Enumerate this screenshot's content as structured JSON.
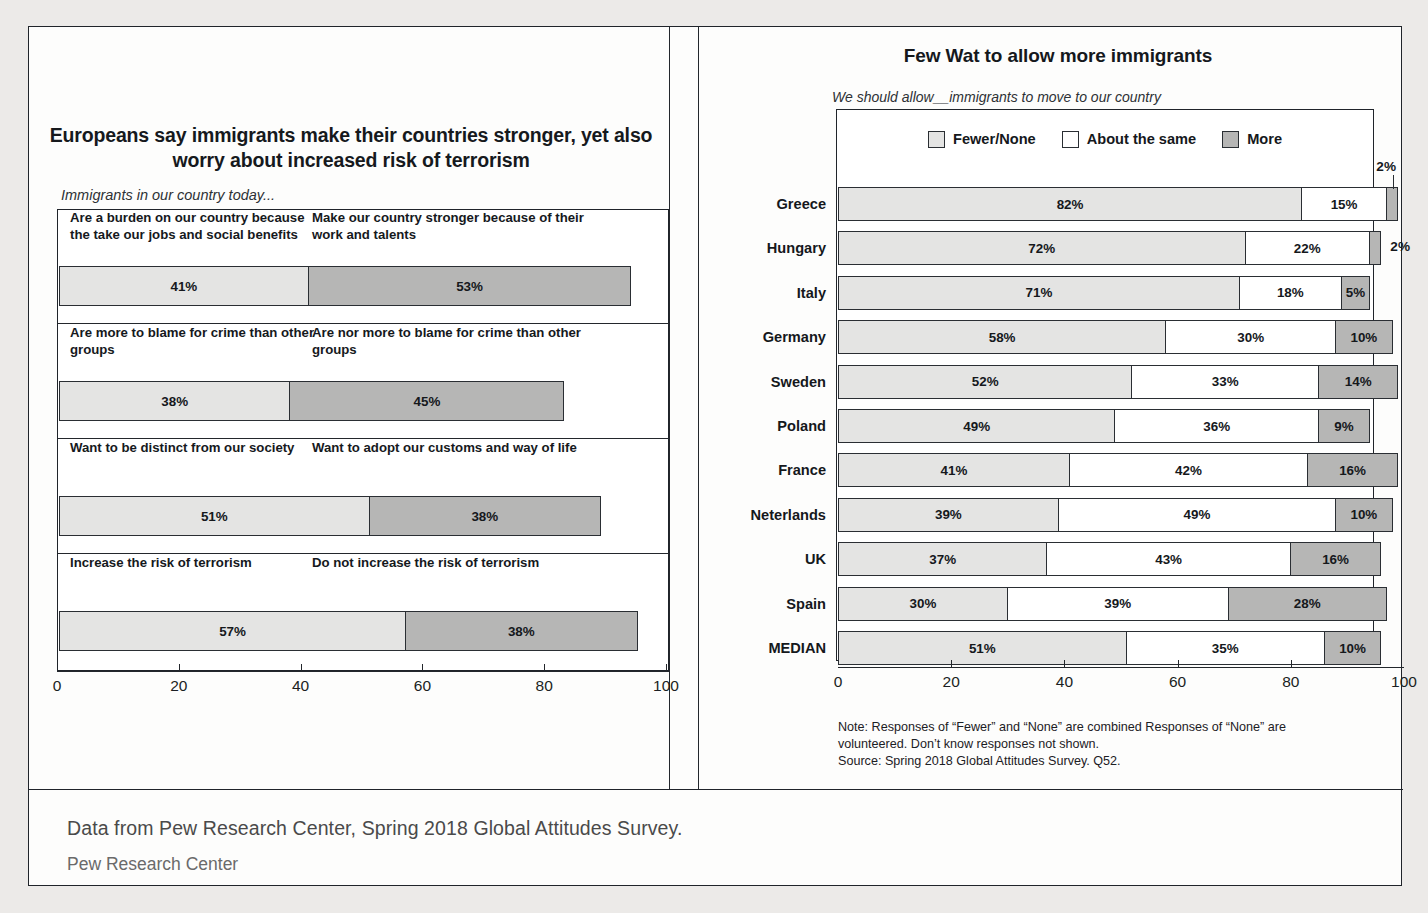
{
  "clipped_top_text": "",
  "footer": {
    "line1": "Data from Pew Research Center, Spring 2018 Global Attitudes Survey.",
    "line2": "Pew Research Center"
  },
  "chart_data": [
    {
      "type": "bar",
      "id": "left-opposing-pairs",
      "title": "Europeans say immigrants make their countries stronger, yet also worry about increased risk of terrorism",
      "subtitle": "Immigrants in our country today...",
      "xlabel": "",
      "ylabel": "",
      "xlim": [
        0,
        100
      ],
      "xticks": [
        0,
        20,
        40,
        60,
        80,
        100
      ],
      "xtick_labels": [
        "0",
        "20",
        "40",
        "60",
        "80",
        "100"
      ],
      "grid": false,
      "legend_position": "none",
      "orientation": "horizontal",
      "stacked": true,
      "series": [
        {
          "name": "Left statement",
          "color": "#e4e4e3"
        },
        {
          "name": "Right statement",
          "color": "#b6b6b5"
        }
      ],
      "rows": [
        {
          "left_label": "Are a burden on our country because the take our jobs and social benefits",
          "right_label": "Make our country stronger because of their work and talents",
          "left_value": 41,
          "right_value": 53,
          "left_value_label": "41%",
          "right_value_label": "53%"
        },
        {
          "left_label": "Are more to blame for crime than other groups",
          "right_label": "Are nor more to blame for crime than other groups",
          "left_value": 38,
          "right_value": 45,
          "left_value_label": "38%",
          "right_value_label": "45%"
        },
        {
          "left_label": "Want to be distinct from our society",
          "right_label": "Want to adopt our customs and way of life",
          "left_value": 51,
          "right_value": 38,
          "left_value_label": "51%",
          "right_value_label": "38%"
        },
        {
          "left_label": "Increase the risk of terrorism",
          "right_label": "Do not increase the risk of terrorism",
          "left_value": 57,
          "right_value": 38,
          "left_value_label": "57%",
          "right_value_label": "38%"
        }
      ]
    },
    {
      "type": "bar",
      "id": "right-allow-immigrants",
      "title": "Few Wat to allow more immigrants",
      "subtitle": "We should allow__immigrants to move to our country",
      "xlabel": "",
      "ylabel": "",
      "xlim": [
        0,
        100
      ],
      "xticks": [
        0,
        20,
        40,
        60,
        80,
        100
      ],
      "xtick_labels": [
        "0",
        "20",
        "40",
        "60",
        "80",
        "100"
      ],
      "grid": false,
      "legend_position": "top",
      "orientation": "horizontal",
      "stacked": true,
      "legend": [
        "Fewer/None",
        "About the same",
        "More"
      ],
      "series": [
        {
          "name": "Fewer/None",
          "color": "#e4e4e3",
          "values": [
            82,
            72,
            71,
            58,
            52,
            49,
            41,
            39,
            37,
            30,
            51
          ]
        },
        {
          "name": "About the same",
          "color": "#ffffff",
          "values": [
            15,
            22,
            18,
            30,
            33,
            36,
            42,
            49,
            43,
            39,
            35
          ]
        },
        {
          "name": "More",
          "color": "#b6b6b5",
          "values": [
            2,
            2,
            5,
            10,
            14,
            9,
            16,
            10,
            16,
            28,
            10
          ]
        }
      ],
      "categories": [
        "Greece",
        "Hungary",
        "Italy",
        "Germany",
        "Sweden",
        "Poland",
        "France",
        "Neterlands",
        "UK",
        "Spain",
        "MEDIAN"
      ],
      "rows": [
        {
          "name": "Greece",
          "few": 82,
          "same": 15,
          "more": 2,
          "few_label": "82%",
          "same_label": "15%",
          "more_label": "2%",
          "more_outside": true,
          "more_leader": "up"
        },
        {
          "name": "Hungary",
          "few": 72,
          "same": 22,
          "more": 2,
          "few_label": "72%",
          "same_label": "22%",
          "more_label": "2%",
          "more_outside": true,
          "more_leader": "none"
        },
        {
          "name": "Italy",
          "few": 71,
          "same": 18,
          "more": 5,
          "few_label": "71%",
          "same_label": "18%",
          "more_label": "5%",
          "more_outside": false
        },
        {
          "name": "Germany",
          "few": 58,
          "same": 30,
          "more": 10,
          "few_label": "58%",
          "same_label": "30%",
          "more_label": "10%",
          "more_outside": false
        },
        {
          "name": "Sweden",
          "few": 52,
          "same": 33,
          "more": 14,
          "few_label": "52%",
          "same_label": "33%",
          "more_label": "14%",
          "more_outside": false
        },
        {
          "name": "Poland",
          "few": 49,
          "same": 36,
          "more": 9,
          "few_label": "49%",
          "same_label": "36%",
          "more_label": "9%",
          "more_outside": false
        },
        {
          "name": "France",
          "few": 41,
          "same": 42,
          "more": 16,
          "few_label": "41%",
          "same_label": "42%",
          "more_label": "16%",
          "more_outside": false
        },
        {
          "name": "Neterlands",
          "few": 39,
          "same": 49,
          "more": 10,
          "few_label": "39%",
          "same_label": "49%",
          "more_label": "10%",
          "more_outside": false
        },
        {
          "name": "UK",
          "few": 37,
          "same": 43,
          "more": 16,
          "few_label": "37%",
          "same_label": "43%",
          "more_label": "16%",
          "more_outside": false
        },
        {
          "name": "Spain",
          "few": 30,
          "same": 39,
          "more": 28,
          "few_label": "30%",
          "same_label": "39%",
          "more_label": "28%",
          "more_outside": false
        },
        {
          "name": "MEDIAN",
          "few": 51,
          "same": 35,
          "more": 10,
          "few_label": "51%",
          "same_label": "35%",
          "more_label": "10%",
          "more_outside": false
        }
      ],
      "note_line1": "Note: Responses of “Fewer” and “None” are combined Responses of “None” are",
      "note_line2": "volunteered. Don’t know responses not shown.",
      "note_line3": "Source: Spring 2018 Global Attitudes Survey. Q52."
    }
  ]
}
